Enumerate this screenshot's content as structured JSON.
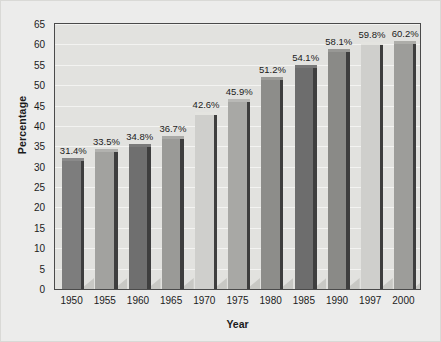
{
  "chart_data": {
    "type": "bar",
    "title": "",
    "xlabel": "Year",
    "ylabel": "Percentage",
    "categories": [
      "1950",
      "1955",
      "1960",
      "1965",
      "1970",
      "1975",
      "1980",
      "1985",
      "1990",
      "1997",
      "2000"
    ],
    "values": [
      31.4,
      33.5,
      34.8,
      36.7,
      42.6,
      45.9,
      51.2,
      54.1,
      58.1,
      59.8,
      60.2
    ],
    "data_labels": [
      "31.4%",
      "33.5%",
      "34.8%",
      "36.7%",
      "42.6%",
      "45.9%",
      "51.2%",
      "54.1%",
      "58.1%",
      "59.8%",
      "60.2%"
    ],
    "ylim": [
      0,
      65
    ],
    "ytick_step": 5,
    "yticks": [
      "0",
      "5",
      "10",
      "15",
      "20",
      "25",
      "30",
      "35",
      "40",
      "45",
      "50",
      "55",
      "60",
      "65"
    ],
    "grid": true,
    "legend": "none",
    "bar_colors": [
      "#7d7d7d",
      "#a2a29f",
      "#6f6f6f",
      "#9a9a97",
      "#cfcfcc",
      "#a8a8a5",
      "#8d8d8a",
      "#6d6d6d",
      "#8a8a87",
      "#cfcfcc",
      "#9d9d9a"
    ],
    "bar_side_color": "#3e3e3e",
    "bar_shadow_color": "#c8c8c4",
    "plot_background": "#e2e2df",
    "figure_background": "#ececeb",
    "gridline_color": "#f3f3f1",
    "axis_color": "#4a4a4a",
    "text_color": "#1b1b1b"
  }
}
